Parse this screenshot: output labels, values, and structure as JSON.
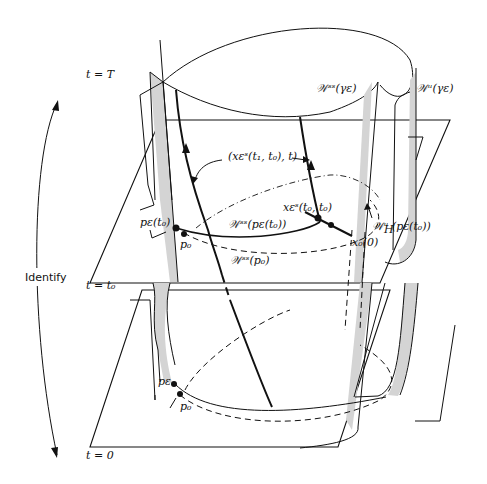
{
  "figure": {
    "type": "manifold-diagram"
  },
  "time_slices": {
    "top": "t = T",
    "middle": "t = t₀",
    "bottom": "t = 0"
  },
  "identify_label": "Identify",
  "labels": {
    "w_ss_gamma": "𝒲ˢˢ(γε)",
    "w_u_gamma": "𝒲ᵘ(γε)",
    "trajectory": "(xεˢ(t₁, t₀), t)",
    "x_eps_t0": "xεˢ(t₀, t₀)",
    "w_ss_pe": "𝒲ˢˢ(pε(t₀))",
    "w_u_pe": "𝒲ᵘ (pε(t₀))",
    "w_ss_p0": "𝒲ˢˢ(p₀)",
    "pe_t0": "pε(t₀)",
    "p0_mid": "p₀",
    "x0": "x₀(0)",
    "H": "H",
    "pe_bottom": "pε",
    "p0_bottom": "p₀"
  },
  "colors": {
    "ink": "#111111",
    "shading": "#d4d4d4",
    "background": "#ffffff"
  }
}
